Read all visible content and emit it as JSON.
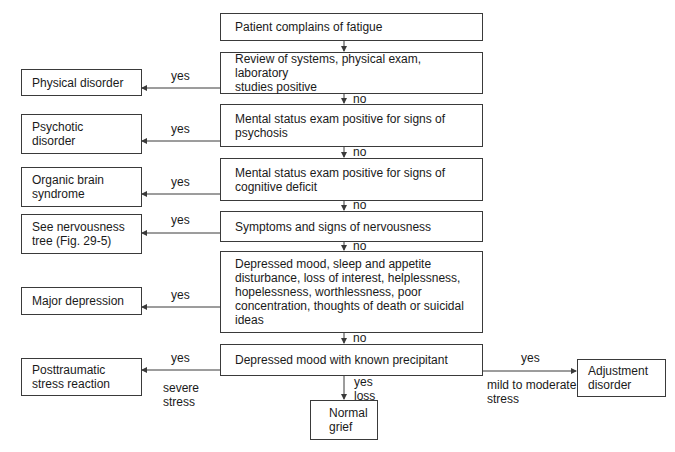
{
  "diagram": {
    "type": "flowchart",
    "nodes": {
      "start": "Patient complains of fatigue",
      "q1": "Review of systems, physical exam, laboratory\nstudies positive",
      "q2": "Mental status exam positive for signs of\npsychosis",
      "q3": "Mental status exam positive for signs of\ncognitive deficit",
      "q4": "Symptoms and signs of nervousness",
      "q5": "Depressed mood, sleep and appetite\ndisturbance, loss of interest, helplessness,\nhopelessness, worthlessness, poor\nconcentration, thoughts of death or suicidal\nideas",
      "q6": "Depressed mood with known precipitant",
      "r1": "Physical disorder",
      "r2": "Psychotic\ndisorder",
      "r3": "Organic brain\nsyndrome",
      "r4": "See nervousness\ntree (Fig. 29-5)",
      "r5": "Major depression",
      "r6": "Posttraumatic\nstress reaction",
      "r7": "Normal\ngrief",
      "r8": "Adjustment\ndisorder"
    },
    "labels": {
      "yes1": "yes",
      "yes2": "yes",
      "yes3": "yes",
      "yes4": "yes",
      "yes5": "yes",
      "yes6": "yes",
      "no1": "no",
      "no2": "no",
      "no3": "no",
      "no4": "no",
      "no5": "no",
      "severe": "severe\nstress",
      "yes_loss": "yes\nloss",
      "yes_right": "yes",
      "mild": "mild to moderate\nstress"
    },
    "line_color": "#3a3a3a"
  }
}
